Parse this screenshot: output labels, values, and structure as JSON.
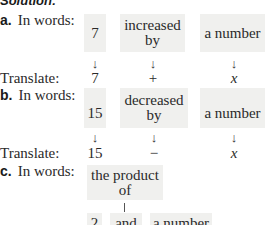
{
  "heading": "Solution:",
  "parts": [
    {
      "letter": "a.",
      "in_words_label": "In words:",
      "boxes": [
        "7",
        "increased by",
        "a number"
      ],
      "box_lines": [
        [
          "7"
        ],
        [
          "increased",
          "by"
        ],
        [
          "a number"
        ]
      ],
      "translate_label": "Translate:",
      "translation": [
        "7",
        "+",
        "x"
      ],
      "arrow": "↓"
    },
    {
      "letter": "b.",
      "in_words_label": "In words:",
      "boxes": [
        "15",
        "decreased by",
        "a number"
      ],
      "box_lines": [
        [
          "15"
        ],
        [
          "decreased",
          "by"
        ],
        [
          "a number"
        ]
      ],
      "translate_label": "Translate:",
      "translation": [
        "15",
        "−",
        "x"
      ],
      "arrow": "↓"
    },
    {
      "letter": "c.",
      "in_words_label": "In words:",
      "top_box_lines": [
        "the product",
        "of"
      ],
      "bottom_boxes": [
        "2",
        "and",
        "a number"
      ]
    }
  ],
  "colors": {
    "box_background": "#f0f0ee",
    "text": "#2a2a2a"
  }
}
